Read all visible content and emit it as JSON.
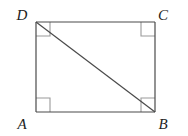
{
  "figure": {
    "kind": "geometry-diagram",
    "shape": "rectangle",
    "name": "Rectangle ABCD with diagonal DB",
    "background_color": "#ffffff",
    "stroke_color": "#4a4a4a",
    "right_angle_mark_color": "#9a9a9a",
    "label_color": "#1d1d1d",
    "stroke_width": 1.2,
    "rect": {
      "left": 36,
      "top": 22,
      "right": 155,
      "bottom": 112,
      "width": 119,
      "height": 90
    },
    "vertices": [
      {
        "id": "D",
        "label": "D",
        "x": 36,
        "y": 22,
        "label_x": 22,
        "label_y": 17,
        "position": "top-left"
      },
      {
        "id": "C",
        "label": "C",
        "x": 155,
        "y": 22,
        "label_x": 163,
        "label_y": 17,
        "position": "top-right"
      },
      {
        "id": "A",
        "label": "A",
        "x": 36,
        "y": 112,
        "label_x": 22,
        "label_y": 126,
        "position": "bottom-left"
      },
      {
        "id": "B",
        "label": "B",
        "x": 155,
        "y": 112,
        "label_x": 163,
        "label_y": 126,
        "position": "bottom-right"
      }
    ],
    "edges": [
      {
        "id": "DC",
        "from": "D",
        "to": "C",
        "x1": 36,
        "y1": 22,
        "x2": 155,
        "y2": 22
      },
      {
        "id": "CB",
        "from": "C",
        "to": "B",
        "x1": 155,
        "y1": 22,
        "x2": 155,
        "y2": 112
      },
      {
        "id": "BA",
        "from": "B",
        "to": "A",
        "x1": 155,
        "y1": 112,
        "x2": 36,
        "y2": 112
      },
      {
        "id": "AD",
        "from": "A",
        "to": "D",
        "x1": 36,
        "y1": 112,
        "x2": 36,
        "y2": 22
      }
    ],
    "diagonal": {
      "id": "DB",
      "from": "D",
      "to": "B",
      "x1": 36,
      "y1": 22,
      "x2": 155,
      "y2": 112
    },
    "right_angle_marks": [
      {
        "id": "mark-D",
        "at": "D",
        "size": 14,
        "points": "50,22 50,36 36,36"
      },
      {
        "id": "mark-C",
        "at": "C",
        "size": 14,
        "points": "141,22 141,36 155,36"
      },
      {
        "id": "mark-A",
        "at": "A",
        "size": 14,
        "points": "50,112 50,98 36,98"
      },
      {
        "id": "mark-B",
        "at": "B",
        "size": 14,
        "points": "141,112 141,98 155,98"
      }
    ]
  }
}
